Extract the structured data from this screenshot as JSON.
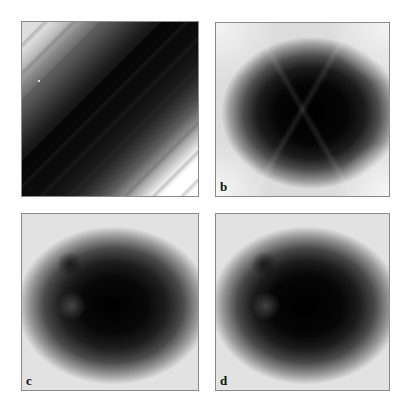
{
  "figure": {
    "panels": [
      {
        "id": "a",
        "label": "a",
        "description": "diagonal dark bands from top-left to bottom-right, white corners top-right and bottom-left"
      },
      {
        "id": "b",
        "label": "b",
        "description": "dark elliptical blob with hexagonal/triangular facets on light gray background"
      },
      {
        "id": "c",
        "label": "c",
        "description": "smooth dark elliptical blob with lighter lobe at lower left, fading to white edges"
      },
      {
        "id": "d",
        "label": "d",
        "description": "smooth dark elliptical blob similar to c, slightly sharper"
      }
    ]
  }
}
